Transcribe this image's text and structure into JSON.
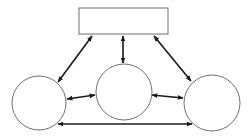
{
  "diagram": {
    "type": "network",
    "nodes": [
      {
        "id": "top",
        "shape": "rectangle",
        "label": ""
      },
      {
        "id": "left",
        "shape": "circle",
        "label": ""
      },
      {
        "id": "middle",
        "shape": "circle",
        "label": ""
      },
      {
        "id": "right",
        "shape": "circle",
        "label": ""
      }
    ],
    "edges": [
      {
        "from": "top",
        "to": "left",
        "direction": "both"
      },
      {
        "from": "top",
        "to": "middle",
        "direction": "both"
      },
      {
        "from": "top",
        "to": "right",
        "direction": "both"
      },
      {
        "from": "left",
        "to": "middle",
        "direction": "both"
      },
      {
        "from": "middle",
        "to": "right",
        "direction": "both"
      },
      {
        "from": "left",
        "to": "right",
        "direction": "both"
      }
    ],
    "colors": {
      "node_stroke": "#6e6e6e",
      "edge": "#1a1a1a",
      "background": "#ffffff"
    }
  }
}
